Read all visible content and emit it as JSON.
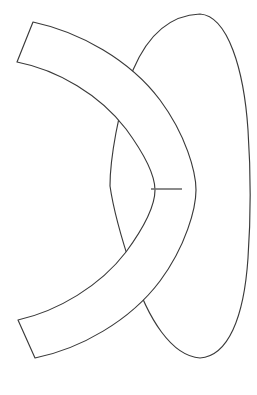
{
  "figure": {
    "title": "Line drawing of two overlapping outlined shapes",
    "background_color": "#ffffff",
    "stroke_color": "#3a3a3a",
    "fill_color": "#ffffff",
    "tick_color": "#6e6e6e",
    "canvas": {
      "width": 257,
      "height": 395
    },
    "shape_count": 3,
    "has_text_labels": false,
    "has_axes": false,
    "has_legend": false
  },
  "shapes": [
    {
      "id": "lens-shape",
      "name": "lens-outline",
      "description": "Large vertical lens / pointed-oval outline on the right side",
      "stroke": "#3a3a3a",
      "fill": "#ffffff",
      "stroke_width": 1.15,
      "extent": {
        "left": 106,
        "right": 250,
        "top": 14,
        "bottom": 359
      },
      "apex_top": {
        "x": 200,
        "y": 14
      },
      "apex_bottom": {
        "x": 200,
        "y": 358
      },
      "rightmost": {
        "x": 249,
        "y": 190
      },
      "leftmost": {
        "x": 107,
        "y": 190
      },
      "path": "M 200 14 C 228 16 244 70 248 130 C 251 175 251 215 248 258 C 244 318 228 356 200 358 C 172 356 148 320 132 270 C 118 228 112 200 110 186 C 110 160 118 110 133 70 C 150 30 174 15 200 14 Z"
    },
    {
      "id": "band-shape",
      "name": "curved-band-outline",
      "description": "C-shaped curved band sweeping from upper-left around to lower-left",
      "stroke": "#3a3a3a",
      "fill": "#ffffff",
      "stroke_width": 1.15,
      "extent": {
        "left": 16,
        "right": 197,
        "top": 21,
        "bottom": 359
      },
      "end_top_outer": {
        "x": 33,
        "y": 22
      },
      "end_top_inner": {
        "x": 17,
        "y": 62
      },
      "end_bottom_inner": {
        "x": 18,
        "y": 320
      },
      "end_bottom_outer": {
        "x": 35,
        "y": 358
      },
      "band_thickness_px": 43,
      "path": "M 33 22 C 80 32 130 60 160 100 C 186 135 196 172 196 190 C 196 208 186 246 160 281 C 130 321 80 349 35 358 L 18 320 C 58 311 100 286 126 252 C 148 222 155 202 155 190 C 155 178 148 159 126 129 C 100 95 58 70 17 62 Z"
    },
    {
      "id": "tick-mark",
      "name": "horizontal-tick-segment",
      "description": "Short horizontal segment joining the band inner edge to the lens right region",
      "stroke": "#6e6e6e",
      "stroke_width": 1.6,
      "x1": 151,
      "y1": 189,
      "x2": 182,
      "y2": 189,
      "length_px": 31,
      "orientation": "horizontal"
    }
  ],
  "intersections": [
    {
      "name": "upper-left-crossing",
      "x": 133,
      "y": 61,
      "description": "band outer edge meets lens upper-left boundary"
    },
    {
      "name": "upper-inner-crossing",
      "x": 108,
      "y": 96,
      "description": "band inner edge meets lens left boundary"
    },
    {
      "name": "lower-inner-crossing",
      "x": 112,
      "y": 283,
      "description": "band inner edge meets lens left boundary"
    },
    {
      "name": "lower-left-crossing",
      "x": 133,
      "y": 318,
      "description": "band outer edge meets lens lower-left boundary"
    }
  ]
}
